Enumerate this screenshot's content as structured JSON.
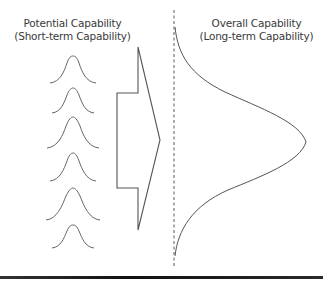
{
  "left_panel": {
    "title_line1": "Potential Capability",
    "title_line2": "(Short-term Capability)",
    "small_distributions_count": 6
  },
  "right_panel": {
    "title_line1": "Overall Capability",
    "title_line2": "(Long-term Capability)"
  },
  "colors": {
    "line": "#555555",
    "text": "#3a3a3a",
    "dashed": "#777777"
  }
}
